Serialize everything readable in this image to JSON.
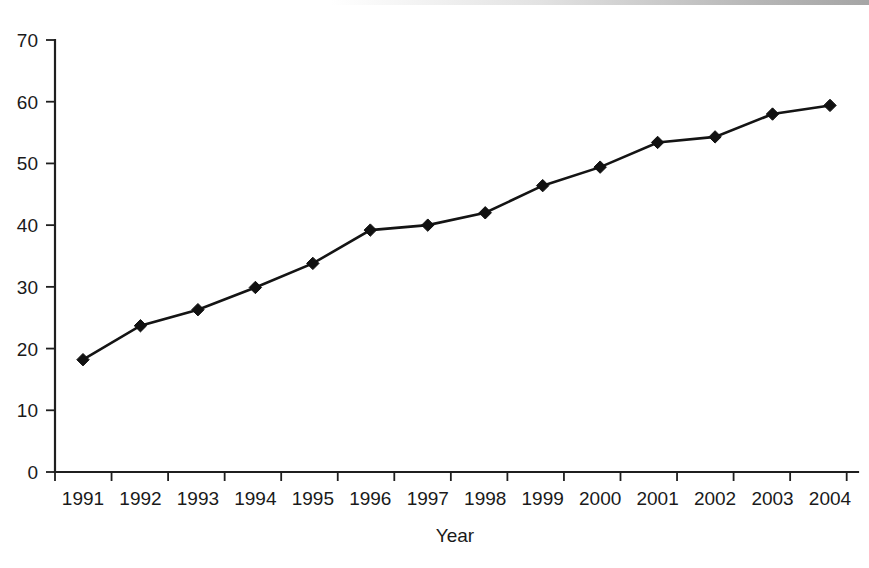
{
  "chart_data": {
    "type": "line",
    "title": "",
    "subtitle": "",
    "xlabel": "Year",
    "ylabel": "",
    "categories": [
      "1991",
      "1992",
      "1993",
      "1994",
      "1995",
      "1996",
      "1997",
      "1998",
      "1999",
      "2000",
      "2001",
      "2002",
      "2003",
      "2004"
    ],
    "x": [
      1991,
      1992,
      1993,
      1994,
      1995,
      1996,
      1997,
      1998,
      1999,
      2000,
      2001,
      2002,
      2003,
      2004
    ],
    "values": [
      18.2,
      23.7,
      26.3,
      29.9,
      33.8,
      39.2,
      40.0,
      42.0,
      46.4,
      49.4,
      53.4,
      54.3,
      58.0,
      59.4
    ],
    "series": [
      {
        "name": "",
        "values": [
          18.2,
          23.7,
          26.3,
          29.9,
          33.8,
          39.2,
          40.0,
          42.0,
          46.4,
          49.4,
          53.4,
          54.3,
          58.0,
          59.4
        ],
        "marker": "diamond",
        "color": "#111111"
      }
    ],
    "ylim": [
      0,
      70
    ],
    "yticks": [
      0,
      10,
      20,
      30,
      40,
      50,
      60,
      70
    ],
    "ytick_labels": [
      "0",
      "10",
      "20",
      "30",
      "40",
      "50",
      "60",
      "70"
    ],
    "xtick_labels": [
      "1991",
      "1992",
      "1993",
      "1994",
      "1995",
      "1996",
      "1997",
      "1998",
      "1999",
      "2000",
      "2001",
      "2002",
      "2003",
      "2004"
    ],
    "grid": false,
    "legend": null,
    "legend_position": "none",
    "annotations": []
  },
  "axis_titles": {
    "x": "Year",
    "y": ""
  },
  "colors": {
    "line": "#111111",
    "marker": "#111111",
    "axis": "#1f1f1f",
    "background": "#ffffff",
    "text": "#1a1a1a"
  }
}
